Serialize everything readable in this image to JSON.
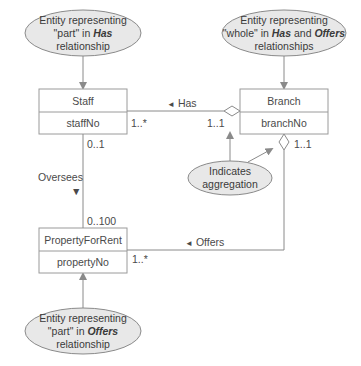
{
  "diagram": {
    "type": "UML class diagram - aggregation",
    "colors": {
      "line": "#8a8a8a",
      "box_border": "#9a9a9a",
      "note_fill": "#e8e8e8",
      "text": "#4a4a4a"
    },
    "classes": [
      {
        "name": "Staff",
        "attribute": "staffNo"
      },
      {
        "name": "Branch",
        "attribute": "branchNo"
      },
      {
        "name": "PropertyForRent",
        "attribute": "propertyNo"
      }
    ],
    "relationships": {
      "has": {
        "label": "Has",
        "arrow": "◄",
        "staff_mult": "1..*",
        "branch_mult": "1..1"
      },
      "oversees": {
        "label": "Oversees",
        "arrow": "▼",
        "staff_mult": "0..1",
        "property_mult": "0..100"
      },
      "offers": {
        "label": "Offers",
        "arrow": "◄",
        "branch_mult": "1..1",
        "property_mult": "1..*"
      }
    },
    "notes": {
      "staff_note": {
        "line1": "Entity representing",
        "line2_pre": "\"part\" in ",
        "line2_em": "Has",
        "line3": "relationship"
      },
      "branch_note": {
        "line1": "Entity representing",
        "line2_pre": "\"whole\" in ",
        "line2_em1": "Has",
        "line2_mid": " and ",
        "line2_em2": "Offers",
        "line3": "relationships"
      },
      "aggregation_note": {
        "line1": "Indicates",
        "line2": "aggregation"
      },
      "property_note": {
        "line1": "Entity representing",
        "line2_pre": "\"part\" in ",
        "line2_em": "Offers",
        "line3": "relationship"
      }
    }
  }
}
